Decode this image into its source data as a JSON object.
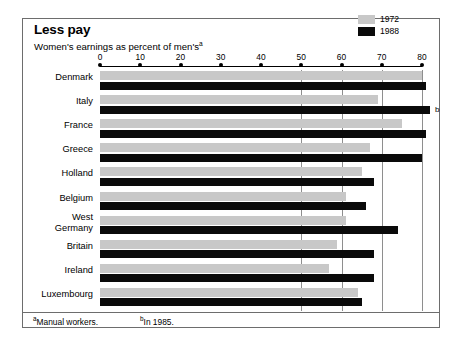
{
  "title": "Less pay",
  "subtitle": "Women's earnings as percent of men's",
  "subtitle_sup": "a",
  "legend": {
    "position": "top-right",
    "items": [
      {
        "label": "1972",
        "color": "#c8c8c8"
      },
      {
        "label": "1988",
        "color": "#0a0a0a"
      }
    ]
  },
  "footnotes": {
    "a_sup": "a",
    "a_text": "Manual workers.",
    "b_sup": "b",
    "b_text": "In 1985."
  },
  "annotations": {
    "italy_b": "b"
  },
  "chart_data": {
    "type": "bar",
    "orientation": "horizontal",
    "title": "Less pay",
    "subtitle": "Women's earnings as percent of men's",
    "xlabel": "",
    "ylabel": "",
    "xlim": [
      0,
      85
    ],
    "ticks": [
      0,
      10,
      20,
      30,
      40,
      50,
      60,
      70,
      80
    ],
    "gridlines": [
      50,
      60,
      70,
      80
    ],
    "grid": true,
    "categories": [
      "Denmark",
      "Italy",
      "France",
      "Greece",
      "Holland",
      "Belgium",
      "West\nGermany",
      "Britain",
      "Ireland",
      "Luxembourg"
    ],
    "series": [
      {
        "name": "1972",
        "color": "#c8c8c8",
        "values": [
          80,
          69,
          75,
          67,
          65,
          61,
          61,
          59,
          57,
          64
        ]
      },
      {
        "name": "1988",
        "color": "#0a0a0a",
        "values": [
          81,
          82,
          81,
          80,
          68,
          66,
          74,
          68,
          68,
          65
        ]
      }
    ],
    "notes": [
      {
        "category": "Italy",
        "series": "1988",
        "marker": "b",
        "text": "In 1985."
      }
    ]
  }
}
